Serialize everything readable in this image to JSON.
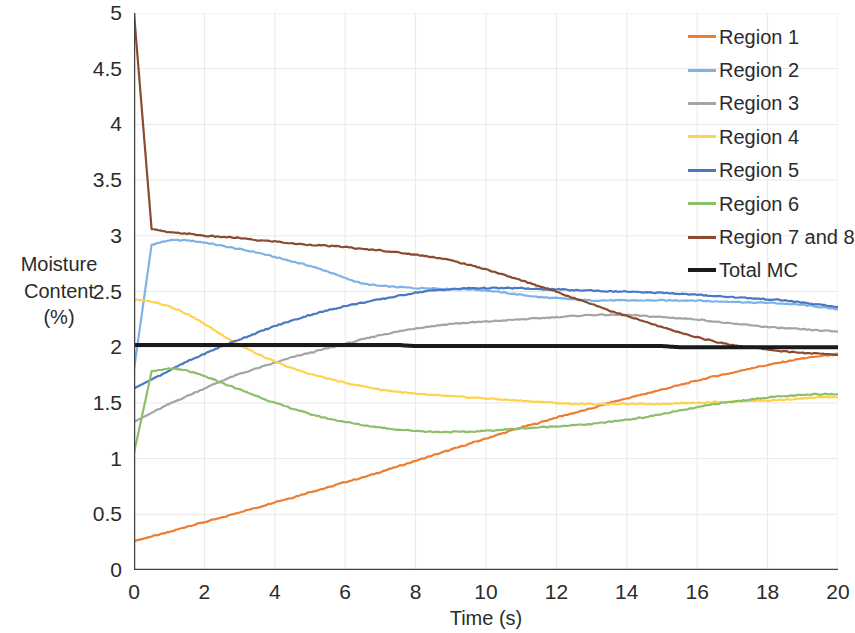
{
  "chart_data": {
    "type": "line",
    "title": "",
    "xlabel": "Time (s)",
    "ylabel": "Moisture Content (%)",
    "ylabel_lines": [
      "Moisture",
      "Content",
      "(%)"
    ],
    "xlim": [
      0,
      20
    ],
    "ylim": [
      0,
      5
    ],
    "x_ticks": [
      0,
      2,
      4,
      6,
      8,
      10,
      12,
      14,
      16,
      18,
      20
    ],
    "x_tick_labels": [
      "0",
      "2",
      "4",
      "6",
      "8",
      "10",
      "12",
      "14",
      "16",
      "18",
      "20"
    ],
    "y_ticks": [
      0,
      0.5,
      1,
      1.5,
      2,
      2.5,
      3,
      3.5,
      4,
      4.5,
      5
    ],
    "y_tick_labels": [
      "0",
      "0.5",
      "1",
      "1.5",
      "2",
      "2.5",
      "3",
      "3.5",
      "4",
      "4.5",
      "5"
    ],
    "grid": "both-light",
    "legend_position": "top-right",
    "x": [
      0,
      0.5,
      1,
      1.5,
      2,
      2.5,
      3,
      3.5,
      4,
      4.5,
      5,
      5.5,
      6,
      6.5,
      7,
      7.5,
      8,
      8.5,
      9,
      9.5,
      10,
      10.5,
      11,
      11.5,
      12,
      12.5,
      13,
      13.5,
      14,
      14.5,
      15,
      15.5,
      16,
      16.5,
      17,
      17.5,
      18,
      18.5,
      19,
      19.5,
      20
    ],
    "series": [
      {
        "name": "Region 1",
        "color": "#ED7D31",
        "values": [
          0.26,
          0.3,
          0.34,
          0.39,
          0.43,
          0.47,
          0.52,
          0.56,
          0.61,
          0.65,
          0.7,
          0.74,
          0.79,
          0.83,
          0.88,
          0.93,
          0.98,
          1.03,
          1.08,
          1.13,
          1.18,
          1.23,
          1.28,
          1.32,
          1.37,
          1.41,
          1.45,
          1.5,
          1.54,
          1.58,
          1.62,
          1.66,
          1.7,
          1.74,
          1.77,
          1.81,
          1.84,
          1.87,
          1.9,
          1.92,
          1.94
        ]
      },
      {
        "name": "Region 2",
        "color": "#7FB2E5",
        "values": [
          1.8,
          2.92,
          2.96,
          2.96,
          2.94,
          2.91,
          2.88,
          2.85,
          2.81,
          2.77,
          2.73,
          2.68,
          2.62,
          2.57,
          2.55,
          2.54,
          2.53,
          2.53,
          2.52,
          2.52,
          2.51,
          2.49,
          2.47,
          2.45,
          2.44,
          2.43,
          2.42,
          2.42,
          2.42,
          2.42,
          2.42,
          2.42,
          2.42,
          2.41,
          2.41,
          2.4,
          2.4,
          2.39,
          2.38,
          2.36,
          2.34
        ]
      },
      {
        "name": "Region 3",
        "color": "#A5A5A5",
        "values": [
          1.33,
          1.41,
          1.49,
          1.56,
          1.63,
          1.7,
          1.76,
          1.81,
          1.86,
          1.91,
          1.95,
          1.99,
          2.03,
          2.07,
          2.11,
          2.14,
          2.17,
          2.19,
          2.21,
          2.22,
          2.23,
          2.24,
          2.25,
          2.26,
          2.27,
          2.28,
          2.29,
          2.29,
          2.29,
          2.28,
          2.27,
          2.26,
          2.25,
          2.23,
          2.21,
          2.2,
          2.18,
          2.17,
          2.16,
          2.15,
          2.14
        ]
      },
      {
        "name": "Region 4",
        "color": "#FFD24D",
        "values": [
          2.43,
          2.41,
          2.37,
          2.3,
          2.21,
          2.11,
          2.02,
          1.94,
          1.87,
          1.81,
          1.76,
          1.72,
          1.68,
          1.65,
          1.62,
          1.6,
          1.58,
          1.57,
          1.56,
          1.55,
          1.54,
          1.53,
          1.52,
          1.51,
          1.5,
          1.49,
          1.49,
          1.49,
          1.49,
          1.49,
          1.49,
          1.5,
          1.5,
          1.51,
          1.51,
          1.52,
          1.52,
          1.53,
          1.54,
          1.55,
          1.55
        ]
      },
      {
        "name": "Region 5",
        "color": "#4A78C2",
        "values": [
          1.63,
          1.71,
          1.79,
          1.87,
          1.94,
          2.01,
          2.07,
          2.13,
          2.19,
          2.24,
          2.29,
          2.33,
          2.37,
          2.4,
          2.43,
          2.46,
          2.49,
          2.51,
          2.52,
          2.53,
          2.53,
          2.53,
          2.53,
          2.52,
          2.52,
          2.51,
          2.51,
          2.5,
          2.5,
          2.49,
          2.49,
          2.48,
          2.47,
          2.46,
          2.45,
          2.44,
          2.43,
          2.42,
          2.4,
          2.38,
          2.36
        ]
      },
      {
        "name": "Region 6",
        "color": "#8CBF6A",
        "values": [
          1.05,
          1.78,
          1.81,
          1.79,
          1.74,
          1.68,
          1.62,
          1.56,
          1.5,
          1.45,
          1.4,
          1.36,
          1.33,
          1.3,
          1.28,
          1.26,
          1.25,
          1.24,
          1.24,
          1.24,
          1.25,
          1.26,
          1.27,
          1.28,
          1.29,
          1.3,
          1.31,
          1.33,
          1.35,
          1.37,
          1.4,
          1.43,
          1.46,
          1.49,
          1.51,
          1.53,
          1.55,
          1.56,
          1.57,
          1.58,
          1.58
        ]
      },
      {
        "name": "Region 7 and 8",
        "color": "#8C4B30",
        "values": [
          5.0,
          3.06,
          3.03,
          3.02,
          3.0,
          2.99,
          2.98,
          2.96,
          2.95,
          2.93,
          2.92,
          2.91,
          2.9,
          2.88,
          2.87,
          2.85,
          2.83,
          2.81,
          2.78,
          2.74,
          2.7,
          2.65,
          2.6,
          2.55,
          2.5,
          2.44,
          2.39,
          2.33,
          2.28,
          2.23,
          2.18,
          2.13,
          2.09,
          2.05,
          2.02,
          2.0,
          1.98,
          1.96,
          1.95,
          1.94,
          1.93
        ]
      },
      {
        "name": "Total MC",
        "color": "#1A1A1A",
        "values": [
          2.02,
          2.02,
          2.02,
          2.02,
          2.02,
          2.02,
          2.02,
          2.02,
          2.02,
          2.02,
          2.02,
          2.02,
          2.02,
          2.02,
          2.02,
          2.02,
          2.01,
          2.01,
          2.01,
          2.01,
          2.01,
          2.01,
          2.01,
          2.01,
          2.01,
          2.01,
          2.01,
          2.01,
          2.01,
          2.01,
          2.01,
          2.0,
          2.0,
          2.0,
          2.0,
          2.0,
          2.0,
          2.0,
          2.0,
          2.0,
          2.0
        ]
      }
    ]
  },
  "legend": {
    "items": [
      {
        "label": "Region 1",
        "color": "#ED7D31"
      },
      {
        "label": "Region 2",
        "color": "#7FB2E5"
      },
      {
        "label": "Region 3",
        "color": "#A5A5A5"
      },
      {
        "label": "Region 4",
        "color": "#FFD24D"
      },
      {
        "label": "Region 5",
        "color": "#4A78C2"
      },
      {
        "label": "Region 6",
        "color": "#8CBF6A"
      },
      {
        "label": "Region 7 and 8",
        "color": "#8C4B30"
      },
      {
        "label": "Total MC",
        "color": "#1A1A1A"
      }
    ]
  },
  "axes": {
    "y_title_lines": [
      "Moisture",
      "Content",
      "(%)"
    ],
    "x_title": "Time (s)"
  },
  "colors": {
    "axis": "#404040",
    "grid": "#E8E8E8",
    "text": "#2b2b2b",
    "background": "#FFFFFF"
  }
}
